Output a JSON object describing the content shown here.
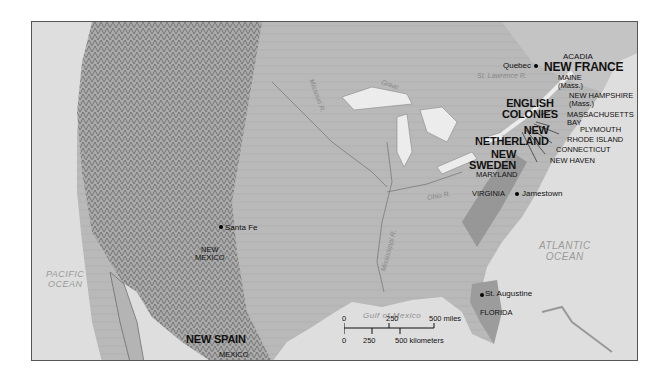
{
  "map": {
    "oceans": {
      "pacific": [
        "PACIFIC",
        "OCEAN"
      ],
      "atlantic": [
        "ATLANTIC",
        "OCEAN"
      ],
      "gulf": "Gulf of Mexico"
    },
    "water_labels": {
      "great_lakes": "Great",
      "st_lawrence": "St. Lawrence R.",
      "missouri": "Missouri R.",
      "ohio": "Ohio R.",
      "mississippi": "Mississippi R."
    },
    "regions": {
      "new_france": "NEW FRANCE",
      "english_colonies": [
        "ENGLISH",
        "COLONIES"
      ],
      "new_netherland": [
        "NEW",
        "NETHERLAND"
      ],
      "new_sweden": [
        "NEW",
        "SWEDEN"
      ],
      "new_spain": "NEW SPAIN"
    },
    "territories": {
      "acadia": "ACADIA",
      "maine": [
        "MAINE",
        "(Mass.)"
      ],
      "new_hampshire": [
        "NEW HAMPSHIRE",
        "(Mass.)"
      ],
      "massachusetts_bay": [
        "MASSACHUSETTS",
        "BAY"
      ],
      "plymouth": "PLYMOUTH",
      "rhode_island": "RHODE ISLAND",
      "connecticut": "CONNECTICUT",
      "new_haven": "NEW HAVEN",
      "maryland": "MARYLAND",
      "virginia": "VIRGINIA",
      "florida": "FLORIDA",
      "new_mexico": [
        "NEW",
        "MEXICO"
      ],
      "mexico": "MEXICO"
    },
    "settlements": {
      "quebec": "Quebec",
      "jamestown": "Jamestown",
      "santa_fe": "Santa Fe",
      "st_augustine": "St. Augustine"
    },
    "scale": {
      "miles": [
        "0",
        "250",
        "500 miles"
      ],
      "kilometers": [
        "0",
        "250",
        "500 kilometers"
      ]
    }
  }
}
